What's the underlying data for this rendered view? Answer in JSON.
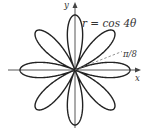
{
  "figure": {
    "equation_label": "r = cos 4θ",
    "angle_label": "π/8",
    "x_axis_label": "x",
    "y_axis_label": "y",
    "curve": {
      "type": "polar-rose",
      "function": "r = cos 4θ",
      "petals": 8,
      "stroke_color": "#222222"
    },
    "axes_color": "#444444",
    "dashed_line_color": "#777777"
  }
}
